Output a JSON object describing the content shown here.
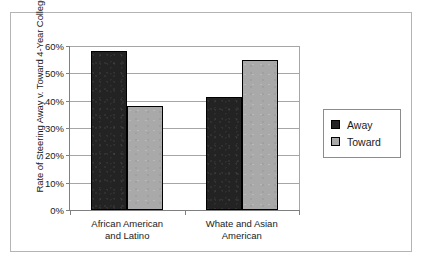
{
  "chart_data": {
    "type": "bar",
    "title": "",
    "xlabel": "",
    "ylabel": "Rate of Steering Away v. Toward 4-Year College",
    "categories": [
      "African American and Latino",
      "Whate and Asian American"
    ],
    "category_lines": [
      [
        "African American",
        "and Latino"
      ],
      [
        "Whate and Asian",
        "American"
      ]
    ],
    "series": [
      {
        "name": "Away",
        "color": "#232323",
        "values": [
          58,
          41.5
        ]
      },
      {
        "name": "Toward",
        "color": "#a9a9a9",
        "values": [
          38,
          55
        ]
      }
    ],
    "ylim": [
      0,
      60
    ],
    "ytick_values": [
      0,
      10,
      20,
      30,
      40,
      50,
      60
    ],
    "ytick_labels": [
      "0%",
      "10%",
      "20%",
      "30%",
      "40%",
      "50%",
      "60%"
    ],
    "grid": "horizontal",
    "legend_position": "right"
  },
  "legend": {
    "items": [
      {
        "label": "Away",
        "swatch": "away"
      },
      {
        "label": "Toward",
        "swatch": "toward"
      }
    ]
  },
  "colors": {
    "away": "#232323",
    "toward": "#a9a9a9",
    "axis": "#808080",
    "gridline": "#a6a6a6",
    "frame": "#b4b4b4",
    "text": "#1a1a1a"
  }
}
